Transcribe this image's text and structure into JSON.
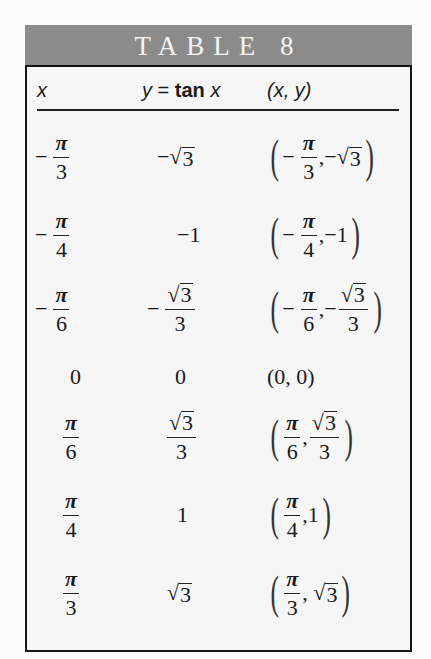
{
  "title": "TABLE 8",
  "colors": {
    "title_band": "#8b8b8b",
    "title_text": "#f4f4f4",
    "body_bg": "#f6f6f6",
    "border": "#151515"
  },
  "header": {
    "col1": "x",
    "col2_var": "y",
    "col2_eq": "=",
    "col2_fn": "tan",
    "col2_arg": "x",
    "col3": "(x, y)"
  },
  "rows": [
    {
      "x": "-π/3",
      "y": "-√3",
      "point": "(-π/3, -√3)"
    },
    {
      "x": "-π/4",
      "y": "-1",
      "point": "(-π/4, -1)"
    },
    {
      "x": "-π/6",
      "y": "-√3/3",
      "point": "(-π/6, -√3/3)"
    },
    {
      "x": "0",
      "y": "0",
      "point": "(0, 0)"
    },
    {
      "x": "π/6",
      "y": "√3/3",
      "point": "(π/6, √3/3)"
    },
    {
      "x": "π/4",
      "y": "1",
      "point": "(π/4, 1)"
    },
    {
      "x": "π/3",
      "y": "√3",
      "point": "(π/3, √3)"
    }
  ],
  "glyphs": {
    "pi": "π",
    "minus": "−",
    "sqrt": "√",
    "three": "3",
    "four": "4",
    "six": "6",
    "one": "1",
    "zero": "0",
    "comma": ",",
    "lparen": "(",
    "rparen": ")",
    "zero_point": "(0, 0)"
  }
}
